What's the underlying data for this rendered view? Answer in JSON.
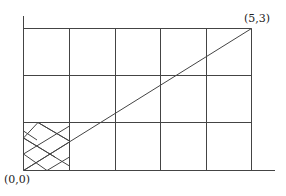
{
  "diagram": {
    "type": "grid-diagram",
    "grid": {
      "columns": 5,
      "rows": 3
    },
    "origin_label": "(0,0)",
    "corner_label": "(5,3)",
    "diagonal": {
      "from": [
        0,
        0
      ],
      "to": [
        5,
        3
      ]
    },
    "hatched_cell": {
      "column": 0,
      "row": 0,
      "pattern": "diamond-crosshatch"
    },
    "line_color": "#444444"
  }
}
